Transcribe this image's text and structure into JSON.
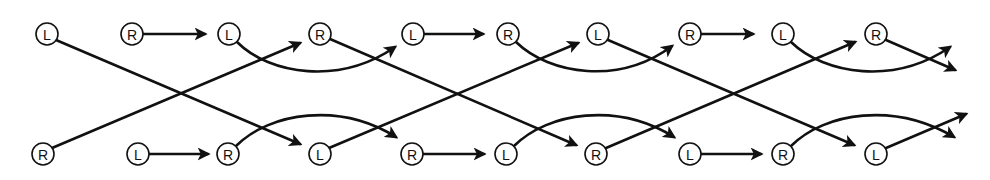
{
  "diagram": {
    "type": "alternating-foot-step-pattern",
    "colors": {
      "stroke": "#111111",
      "background": "#ffffff"
    },
    "node_radius": 11,
    "nodes": [
      {
        "id": "t1",
        "label": "L",
        "x": 47,
        "y": 34
      },
      {
        "id": "t2",
        "label": "R",
        "x": 132,
        "y": 34
      },
      {
        "id": "t3",
        "label": "L",
        "x": 229,
        "y": 34
      },
      {
        "id": "t4",
        "label": "R",
        "x": 320,
        "y": 34
      },
      {
        "id": "t5",
        "label": "L",
        "x": 413,
        "y": 34
      },
      {
        "id": "t6",
        "label": "R",
        "x": 508,
        "y": 34
      },
      {
        "id": "t7",
        "label": "L",
        "x": 598,
        "y": 34
      },
      {
        "id": "t8",
        "label": "R",
        "x": 690,
        "y": 34
      },
      {
        "id": "t9",
        "label": "L",
        "x": 783,
        "y": 34
      },
      {
        "id": "t10",
        "label": "R",
        "x": 876,
        "y": 34
      },
      {
        "id": "b1",
        "label": "R",
        "x": 43,
        "y": 154
      },
      {
        "id": "b2",
        "label": "L",
        "x": 138,
        "y": 154
      },
      {
        "id": "b3",
        "label": "R",
        "x": 228,
        "y": 154
      },
      {
        "id": "b4",
        "label": "L",
        "x": 320,
        "y": 154
      },
      {
        "id": "b5",
        "label": "R",
        "x": 412,
        "y": 154
      },
      {
        "id": "b6",
        "label": "L",
        "x": 506,
        "y": 154
      },
      {
        "id": "b7",
        "label": "R",
        "x": 596,
        "y": 154
      },
      {
        "id": "b8",
        "label": "L",
        "x": 690,
        "y": 154
      },
      {
        "id": "b9",
        "label": "R",
        "x": 783,
        "y": 154
      },
      {
        "id": "b10",
        "label": "L",
        "x": 876,
        "y": 154
      }
    ],
    "edges": [
      {
        "from": "t1",
        "to": "b4",
        "kind": "straight",
        "d": "M56,40 L300,144"
      },
      {
        "from": "b1",
        "to": "t4",
        "kind": "straight",
        "d": "M52,148 L300,43"
      },
      {
        "from": "t2",
        "to": "t3",
        "kind": "straight",
        "d": "M143,34 L205,34"
      },
      {
        "from": "b2",
        "to": "b3",
        "kind": "straight",
        "d": "M149,154 L208,154"
      },
      {
        "from": "t3",
        "to": "t5",
        "kind": "curve",
        "d": "M237,42 C270,75 340,85 395,47"
      },
      {
        "from": "b3",
        "to": "b5",
        "kind": "curve",
        "d": "M236,146 C270,112 340,102 396,137"
      },
      {
        "from": "t4",
        "to": "b7",
        "kind": "straight",
        "d": "M330,39 L576,145"
      },
      {
        "from": "b4",
        "to": "t7",
        "kind": "straight",
        "d": "M329,148 L578,43"
      },
      {
        "from": "t5",
        "to": "t6",
        "kind": "straight",
        "d": "M424,34 L483,34"
      },
      {
        "from": "b5",
        "to": "b6",
        "kind": "straight",
        "d": "M423,154 L484,154"
      },
      {
        "from": "t6",
        "to": "t8",
        "kind": "curve",
        "d": "M516,42 C550,75 620,85 672,46"
      },
      {
        "from": "b6",
        "to": "b8",
        "kind": "curve",
        "d": "M514,146 C548,112 618,102 674,137"
      },
      {
        "from": "t7",
        "to": "b10",
        "kind": "straight",
        "d": "M608,40 L854,145"
      },
      {
        "from": "b7",
        "to": "t10",
        "kind": "straight",
        "d": "M606,148 L855,42"
      },
      {
        "from": "t8",
        "to": "t9",
        "kind": "straight",
        "d": "M701,34 L753,34"
      },
      {
        "from": "b8",
        "to": "b9",
        "kind": "straight",
        "d": "M701,154 L761,154"
      },
      {
        "from": "t9",
        "to": "exit-top-1",
        "kind": "curve",
        "d": "M791,42 C825,75 895,85 950,47"
      },
      {
        "from": "b9",
        "to": "exit-bottom-1",
        "kind": "curve",
        "d": "M791,146 C825,112 895,102 954,137"
      },
      {
        "from": "t10",
        "to": "exit-top-2",
        "kind": "straight",
        "d": "M886,40 L955,70"
      },
      {
        "from": "b10",
        "to": "exit-bottom-2",
        "kind": "straight",
        "d": "M886,148 L966,114"
      }
    ]
  }
}
